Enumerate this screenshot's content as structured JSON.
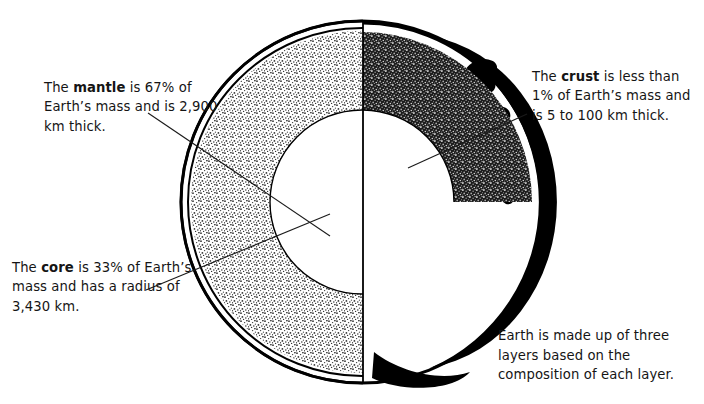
{
  "figure": {
    "background_color": "#ffffff",
    "ink_color": "#111111"
  },
  "callouts": {
    "mantle": {
      "lead_text": "The ",
      "term": "mantle",
      "rest_text": " is 67% of Earth’s mass and is 2,900 km thick.",
      "full_text": "The mantle is 67% of Earth’s mass and is 2,900 km thick.",
      "percent_of_mass": "67%",
      "thickness": "2,900 km"
    },
    "crust": {
      "lead_text": "The ",
      "term": "crust",
      "rest_text": " is less than 1% of Earth’s mass and is 5 to 100 km thick.",
      "full_text": "The crust is less than 1% of Earth’s mass and is 5 to 100 km thick.",
      "percent_of_mass": "less than 1%",
      "thickness": "5 to 100 km"
    },
    "core": {
      "lead_text": "The ",
      "term": "core",
      "rest_text": " is 33% of Earth’s mass and has a radius of 3,430 km.",
      "full_text": "The core is 33% of Earth’s mass and has a radius of 3,430 km.",
      "percent_of_mass": "33%",
      "radius": "3,430 km"
    },
    "summary": {
      "full_text": "Earth is made up of three layers based on the composition of each layer.",
      "layer_count": "three"
    }
  },
  "diagram": {
    "globe": {
      "center_x": 362,
      "center_y": 202,
      "radius": 181
    },
    "layers": [
      {
        "name": "crust",
        "fill": "#ffffff",
        "outer_radius": 181,
        "inner_radius": 172
      },
      {
        "name": "mantle-left",
        "fill": "#e8e8e8",
        "outer_radius": 170,
        "inner_radius": 92
      },
      {
        "name": "mantle-right",
        "fill": "#3a3a3a",
        "outer_radius": 170,
        "inner_radius": 92
      },
      {
        "name": "core",
        "fill": "#ffffff",
        "outer_radius": 92,
        "inner_radius": 0
      }
    ],
    "surface_half": {
      "name": "earth-surface-right-half",
      "ocean_fill": "#ffffff",
      "land_fill": "#000000",
      "shadow_fill": "#000000"
    }
  }
}
